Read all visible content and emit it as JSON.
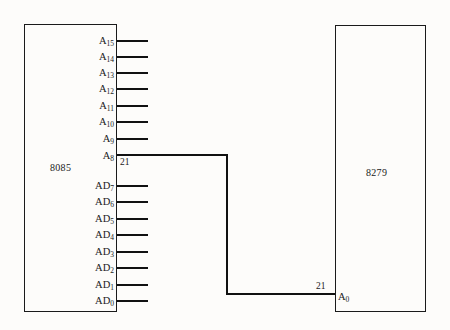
{
  "diagram": {
    "line_color": "#111111",
    "background_color": "#fdfcfa",
    "chips": [
      {
        "id": "chip-left",
        "name": "8085",
        "label": "8085",
        "pins": [
          {
            "name": "A15",
            "base": "A",
            "sub": "15",
            "y": 40,
            "connected": false
          },
          {
            "name": "A14",
            "base": "A",
            "sub": "14",
            "y": 56,
            "connected": false
          },
          {
            "name": "A13",
            "base": "A",
            "sub": "13",
            "y": 72,
            "connected": false
          },
          {
            "name": "A12",
            "base": "A",
            "sub": "12",
            "y": 88,
            "connected": false
          },
          {
            "name": "A11",
            "base": "A",
            "sub": "11",
            "y": 105,
            "connected": false
          },
          {
            "name": "A10",
            "base": "A",
            "sub": "10",
            "y": 121,
            "connected": false
          },
          {
            "name": "A9",
            "base": "A",
            "sub": "9",
            "y": 138,
            "connected": false
          },
          {
            "name": "A8",
            "base": "A",
            "sub": "8",
            "y": 155,
            "connected": true
          },
          {
            "name": "AD7",
            "base": "AD",
            "sub": "7",
            "y": 185,
            "connected": false
          },
          {
            "name": "AD6",
            "base": "AD",
            "sub": "6",
            "y": 201,
            "connected": false
          },
          {
            "name": "AD5",
            "base": "AD",
            "sub": "5",
            "y": 218,
            "connected": false
          },
          {
            "name": "AD4",
            "base": "AD",
            "sub": "4",
            "y": 234,
            "connected": false
          },
          {
            "name": "AD3",
            "base": "AD",
            "sub": "3",
            "y": 251,
            "connected": false
          },
          {
            "name": "AD2",
            "base": "AD",
            "sub": "2",
            "y": 267,
            "connected": false
          },
          {
            "name": "AD1",
            "base": "AD",
            "sub": "1",
            "y": 284,
            "connected": false
          },
          {
            "name": "AD0",
            "base": "AD",
            "sub": "0",
            "y": 300,
            "connected": false
          }
        ]
      },
      {
        "id": "chip-right",
        "name": "8279",
        "label": "8279",
        "pins": [
          {
            "name": "A0",
            "base": "A",
            "sub": "0",
            "y": 296,
            "connected": true
          }
        ]
      }
    ],
    "connection": {
      "from_pin": "A8",
      "from_pin_number": "21",
      "to_pin": "A0",
      "to_pin_number": "21",
      "description": "A8 of 8085 routed to A0 of 8279"
    }
  }
}
